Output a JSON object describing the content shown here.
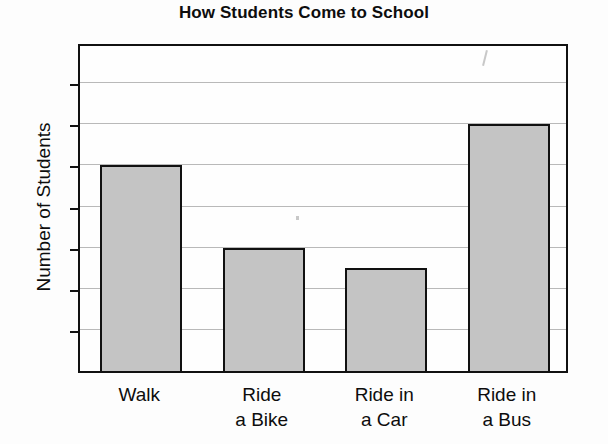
{
  "chart_data": {
    "type": "bar",
    "title": "How Students Come to School",
    "xlabel": "",
    "ylabel": "Number of Students",
    "categories": [
      "Walk",
      "Ride a Bike",
      "Ride in a Car",
      "Ride in a Bus"
    ],
    "category_lines": [
      [
        "Walk"
      ],
      [
        "Ride",
        "a Bike"
      ],
      [
        "Ride in",
        "a Car"
      ],
      [
        "Ride in",
        "a Bus"
      ]
    ],
    "values": [
      10,
      6,
      5,
      12
    ],
    "ylim": [
      0,
      16
    ],
    "ytick_step": 2,
    "yticks": [
      0,
      2,
      4,
      6,
      8,
      10,
      12,
      14,
      16
    ],
    "ytick_labels": [
      "0",
      "2",
      "4",
      "6",
      "8",
      "10",
      "12",
      "14",
      "16"
    ],
    "grid": true,
    "legend": "none",
    "bar_fill_color": "#c4c4c4",
    "bar_edge_color": "#111111",
    "background_color": "#fdfdfd",
    "gridline_color": "#b9b9b9"
  }
}
